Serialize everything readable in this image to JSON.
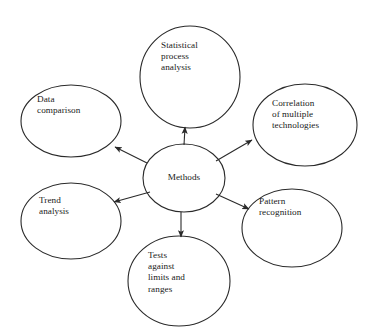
{
  "diagram": {
    "type": "radial-hub-and-spoke",
    "title": "Methods",
    "stroke_color": "#2a2a2a",
    "text_color": "#1a1a1a",
    "background_color": "#ffffff",
    "center_node": {
      "id": "methods",
      "label": "Methods",
      "shape": "ellipse",
      "cx": 184,
      "cy": 178,
      "rx": 41,
      "ry": 34
    },
    "nodes": [
      {
        "id": "statistical-process-analysis",
        "label": "Statistical\nprocess\nanalysis",
        "shape": "ellipse",
        "cx": 190,
        "cy": 77,
        "rx": 50,
        "ry": 51,
        "label_x": 161,
        "label_y": 40,
        "align": "left"
      },
      {
        "id": "correlation-of-multiple-technologies",
        "label": "Correlation\nof multiple\ntechnologies",
        "shape": "ellipse",
        "cx": 305,
        "cy": 125,
        "rx": 52,
        "ry": 41,
        "label_x": 272,
        "label_y": 98,
        "align": "left"
      },
      {
        "id": "pattern-recognition",
        "label": "Pattern\nrecognition",
        "shape": "ellipse",
        "cx": 292,
        "cy": 228,
        "rx": 50,
        "ry": 39,
        "label_x": 259,
        "label_y": 196,
        "align": "left"
      },
      {
        "id": "tests-against-limits-and-ranges",
        "label": "Tests\nagainst\nlimits and\nranges",
        "shape": "ellipse",
        "cx": 179,
        "cy": 281,
        "rx": 51,
        "ry": 45,
        "label_x": 148,
        "label_y": 250,
        "align": "left"
      },
      {
        "id": "trend-analysis",
        "label": "Trend\nanalysis",
        "shape": "ellipse",
        "cx": 71,
        "cy": 221,
        "rx": 50,
        "ry": 38,
        "label_x": 39,
        "label_y": 195,
        "align": "left"
      },
      {
        "id": "data-comparison",
        "label": "Data\ncomparison",
        "shape": "ellipse",
        "cx": 71,
        "cy": 121,
        "rx": 50,
        "ry": 36,
        "label_x": 37,
        "label_y": 94,
        "align": "left"
      }
    ],
    "arrows": [
      {
        "id": "methods-to-statistical-process-analysis",
        "from": "methods",
        "to": "statistical-process-analysis",
        "x1": 184,
        "y1": 145,
        "x2": 185,
        "y2": 127,
        "direction": "up"
      },
      {
        "id": "methods-to-correlation-of-multiple-technologies",
        "from": "methods",
        "to": "correlation-of-multiple-technologies",
        "x1": 216,
        "y1": 161,
        "x2": 252,
        "y2": 140,
        "direction": "up-right"
      },
      {
        "id": "methods-to-pattern-recognition",
        "from": "methods",
        "to": "pattern-recognition",
        "x1": 216,
        "y1": 194,
        "x2": 249,
        "y2": 209,
        "direction": "down-right"
      },
      {
        "id": "methods-to-tests-against-limits-and-ranges",
        "from": "methods",
        "to": "tests-against-limits-and-ranges",
        "x1": 181,
        "y1": 212,
        "x2": 181,
        "y2": 237,
        "direction": "down"
      },
      {
        "id": "methods-to-trend-analysis",
        "from": "methods",
        "to": "trend-analysis",
        "x1": 150,
        "y1": 192,
        "x2": 114,
        "y2": 202,
        "direction": "down-left"
      },
      {
        "id": "methods-to-data-comparison",
        "from": "methods",
        "to": "data-comparison",
        "x1": 147,
        "y1": 163,
        "x2": 115,
        "y2": 147,
        "direction": "up-left"
      }
    ]
  }
}
